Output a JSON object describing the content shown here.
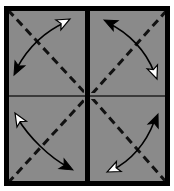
{
  "figure": {
    "width": 174,
    "height": 191,
    "background_color": "#ffffff",
    "panel_fill_color": "#8a8a8a",
    "border_color": "#000000",
    "dashed_line_color": "#111111",
    "curve_color": "#000000",
    "filled_arrowhead_color": "#000000",
    "hollow_arrowhead_color": "#ffffff",
    "hollow_arrowhead_outline_color": "#000000",
    "highlight_line_color": "#c8c8c8",
    "outer_border_width": 5,
    "vertical_divider_width": 5,
    "horizontal_divider_width": 2,
    "dash_pattern": "8 5",
    "dash_width": 3,
    "curve_width": 1.6
  },
  "layout": {
    "frame": {
      "x": 4,
      "y": 6,
      "width": 166,
      "height": 180
    },
    "vertical_divider_x": 87,
    "horizontal_divider_y": 96
  },
  "quadrants": [
    {
      "id": "top-left",
      "label": "Top-left quadrant",
      "bounds": {
        "x": 7,
        "y": 9,
        "width": 77,
        "height": 84
      },
      "diagonal": {
        "from": [
          10,
          12
        ],
        "to": [
          84,
          92
        ],
        "direction": "top-left-to-bottom-right"
      },
      "curve": {
        "path": "M 66 22 C 48 30 30 44 16 70",
        "start_arrowhead": "hollow",
        "end_arrowhead": "filled",
        "start_point": [
          66,
          22
        ],
        "end_point": [
          16,
          70
        ],
        "start_angle_deg": -30,
        "end_angle_deg": 118
      }
    },
    {
      "id": "top-right",
      "label": "Top-right quadrant",
      "bounds": {
        "x": 91,
        "y": 9,
        "width": 76,
        "height": 84
      },
      "diagonal": {
        "from": [
          94,
          92
        ],
        "to": [
          166,
          12
        ],
        "direction": "bottom-left-to-top-right"
      },
      "curve": {
        "path": "M 107 22 C 128 32 146 50 155 74",
        "start_arrowhead": "filled",
        "end_arrowhead": "hollow",
        "start_point": [
          107,
          22
        ],
        "end_point": [
          155,
          74
        ],
        "start_angle_deg": 205,
        "end_angle_deg": 68
      }
    },
    {
      "id": "bottom-left",
      "label": "Bottom-left quadrant",
      "bounds": {
        "x": 7,
        "y": 99,
        "width": 77,
        "height": 84
      },
      "diagonal": {
        "from": [
          10,
          181
        ],
        "to": [
          84,
          100
        ],
        "direction": "bottom-left-to-top-right"
      },
      "curve": {
        "path": "M 17 117 C 28 135 48 156 70 169",
        "start_arrowhead": "hollow",
        "end_arrowhead": "filled",
        "start_point": [
          17,
          117
        ],
        "end_point": [
          70,
          169
        ],
        "start_angle_deg": 238,
        "end_angle_deg": 32
      }
    },
    {
      "id": "bottom-right",
      "label": "Bottom-right quadrant",
      "bounds": {
        "x": 91,
        "y": 99,
        "width": 76,
        "height": 84
      },
      "diagonal": {
        "from": [
          94,
          100
        ],
        "to": [
          166,
          181
        ],
        "direction": "top-left-to-bottom-right"
      },
      "curve": {
        "path": "M 110 170 C 130 160 146 142 155 119",
        "start_arrowhead": "hollow",
        "end_arrowhead": "filled",
        "start_point": [
          110,
          170
        ],
        "end_point": [
          155,
          119
        ],
        "start_angle_deg": 152,
        "end_angle_deg": -68
      }
    }
  ],
  "legend": {
    "hollow_head_meaning": "hollow arrowhead",
    "filled_head_meaning": "filled arrowhead",
    "dashed_line_meaning": "fold diagonal"
  }
}
